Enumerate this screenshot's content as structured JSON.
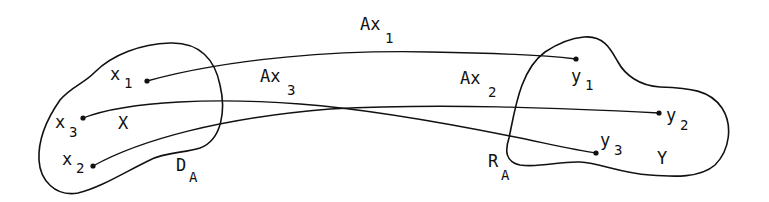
{
  "diagram": {
    "type": "mapping-diagram",
    "sets": {
      "domain_set": {
        "label": "X"
      },
      "codomain_set": {
        "label": "Y"
      },
      "domain": {
        "label": "D",
        "subscript": "A"
      },
      "range": {
        "label": "R",
        "subscript": "A"
      }
    },
    "points": {
      "x1": {
        "base": "x",
        "sub": "1"
      },
      "x2": {
        "base": "x",
        "sub": "2"
      },
      "x3": {
        "base": "x",
        "sub": "3"
      },
      "y1": {
        "base": "y",
        "sub": "1"
      },
      "y2": {
        "base": "y",
        "sub": "2"
      },
      "y3": {
        "base": "y",
        "sub": "3"
      }
    },
    "mappings": [
      {
        "from": "x1",
        "to": "y1",
        "base": "Ax",
        "sub": "1"
      },
      {
        "from": "x2",
        "to": "y2",
        "base": "Ax",
        "sub": "2"
      },
      {
        "from": "x3",
        "to": "y3",
        "base": "Ax",
        "sub": "3"
      }
    ]
  }
}
